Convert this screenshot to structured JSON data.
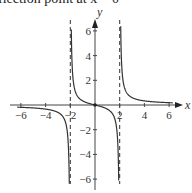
{
  "caption": "flection point at x = 0",
  "chart_data": {
    "type": "line",
    "title": "",
    "function": "f(x) = x/(x^2 - 4)",
    "xlabel": "x",
    "ylabel": "y",
    "xlim": [
      -6.5,
      6.5
    ],
    "ylim": [
      -6.5,
      6.5
    ],
    "x_ticks": [
      -6,
      -4,
      -2,
      2,
      4,
      6
    ],
    "y_ticks": [
      -6,
      -4,
      -2,
      2,
      4,
      6
    ],
    "x_tick_labels": [
      "−6",
      "−4",
      "−2",
      "2",
      "4",
      "6"
    ],
    "y_tick_labels": [
      "−6",
      "−4",
      "−2",
      "2",
      "4",
      "6"
    ],
    "vertical_asymptotes": [
      -2,
      2
    ],
    "horizontal_asymptote": 0,
    "inflection_point": [
      0,
      0
    ],
    "grid": false,
    "legend": null,
    "series": [
      {
        "name": "left branch",
        "x": [
          -6.3,
          -5,
          -4,
          -3,
          -2.5,
          -2.2,
          -2.08
        ],
        "y": [
          -0.176,
          -0.238,
          -0.333,
          -0.6,
          -1.111,
          -2.619,
          -6.37
        ]
      },
      {
        "name": "middle branch",
        "x": [
          -1.92,
          -1.8,
          -1.5,
          -1,
          0,
          1,
          1.5,
          1.8,
          1.92
        ],
        "y": [
          6.12,
          2.368,
          0.857,
          0.333,
          0,
          -0.333,
          -0.857,
          -2.368,
          -6.12
        ]
      },
      {
        "name": "right branch",
        "x": [
          2.08,
          2.2,
          2.5,
          3,
          4,
          5,
          6.3
        ],
        "y": [
          6.37,
          2.619,
          1.111,
          0.6,
          0.333,
          0.238,
          0.176
        ]
      }
    ]
  }
}
